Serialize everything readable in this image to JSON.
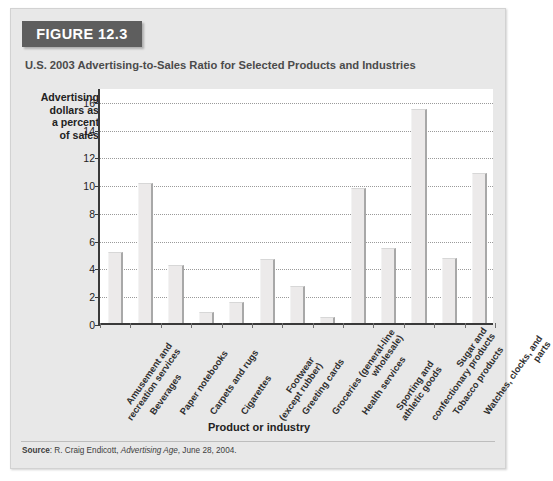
{
  "figure": {
    "badge_label": "FIGURE 12.3",
    "subtitle": "U.S. 2003 Advertising-to-Sales Ratio for Selected Products and Industries",
    "source_prefix": "Source",
    "source_colon": ": R. Craig Endicott, ",
    "source_italic": "Advertising Age",
    "source_suffix": ", June 28, 2004."
  },
  "colors": {
    "panel_bg": "#e8e8e8",
    "badge_bg": "#5e5e5e",
    "badge_text": "#ffffff",
    "plot_bg": "#ffffff",
    "bar_fill": "#eceaea",
    "bar_shadow": "#a8a8a8",
    "axis": "#3a3a3a",
    "gridline": "#9a9a9a",
    "subtitle_text": "#4b4b4b"
  },
  "chart_data": {
    "type": "bar",
    "title": "U.S. 2003 Advertising-to-Sales Ratio for Selected Products and Industries",
    "xlabel": "Product or industry",
    "ylabel": "Advertising dollars as a percent of sales",
    "ylabel_lines": [
      "Advertising",
      "dollars as",
      "a percent",
      "of sales"
    ],
    "ylim": [
      0,
      17
    ],
    "yticks": [
      0,
      2,
      4,
      6,
      8,
      10,
      12,
      14,
      16
    ],
    "ytick_labels": [
      "0",
      "2",
      "4",
      "6",
      "8",
      "10",
      "12",
      "14",
      "16"
    ],
    "grid": "horizontal-dotted",
    "legend": "none",
    "categories": [
      "Amusement and\nrecreation services",
      "Beverages",
      "Paper notebooks",
      "Carpets and rugs",
      "Cigarettes",
      "Footwear\n(except rubber)",
      "Greeting cards",
      "Groceries (general-line\nwholesale)",
      "Health services",
      "Sporting and\nathletic goods",
      "Sugar and\nconfectionary products",
      "Tobacco products",
      "Watches, clocks, and\nparts"
    ],
    "values": [
      5.1,
      10.1,
      4.2,
      0.8,
      1.5,
      4.6,
      2.7,
      0.4,
      9.7,
      5.4,
      15.4,
      4.7,
      10.8
    ]
  }
}
